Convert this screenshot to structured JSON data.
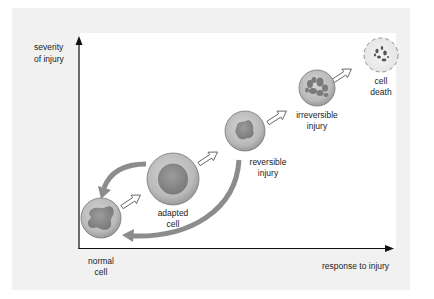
{
  "diagram": {
    "axes": {
      "y_label": "severity\nof injury",
      "x_label": "response to injury"
    },
    "stages": [
      {
        "id": "normal",
        "label": "normal\ncell"
      },
      {
        "id": "adapted",
        "label": "adapted\ncell"
      },
      {
        "id": "reversible",
        "label": "reversible\ninjury"
      },
      {
        "id": "irreversible",
        "label": "irreversible\ninjury"
      },
      {
        "id": "death",
        "label": "cell\ndeath"
      }
    ],
    "transitions": [
      {
        "from": "normal",
        "to": "adapted",
        "style": "hollow-arrow"
      },
      {
        "from": "adapted",
        "to": "reversible",
        "style": "hollow-arrow"
      },
      {
        "from": "reversible",
        "to": "irreversible",
        "style": "hollow-arrow"
      },
      {
        "from": "irreversible",
        "to": "death",
        "style": "hollow-arrow"
      },
      {
        "from": "adapted",
        "to": "normal",
        "style": "curved-gray-arrow"
      },
      {
        "from": "reversible",
        "to": "normal",
        "style": "curved-gray-arrow"
      }
    ],
    "colors": {
      "panel": "#f1f1f1",
      "plot": "#ffffff",
      "cell_outer": "#b8b8b8",
      "cell_nucleus": "#8a8a8a",
      "return_arrow": "#8c8c8c",
      "axis": "#111111"
    }
  }
}
